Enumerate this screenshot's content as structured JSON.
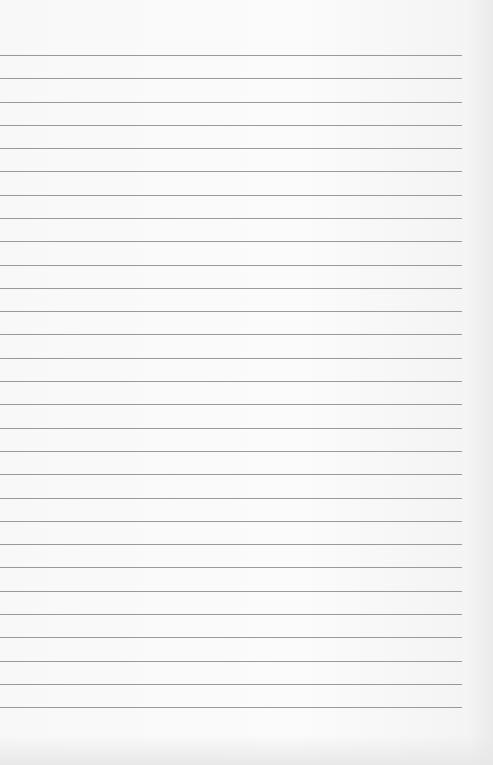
{
  "page": {
    "type": "lined-paper",
    "line_count": 29,
    "first_line_y": 55,
    "line_spacing": 23.29,
    "line_width": 462,
    "line_color": "#8a8a8a",
    "paper_color": "#f8f8f8"
  }
}
